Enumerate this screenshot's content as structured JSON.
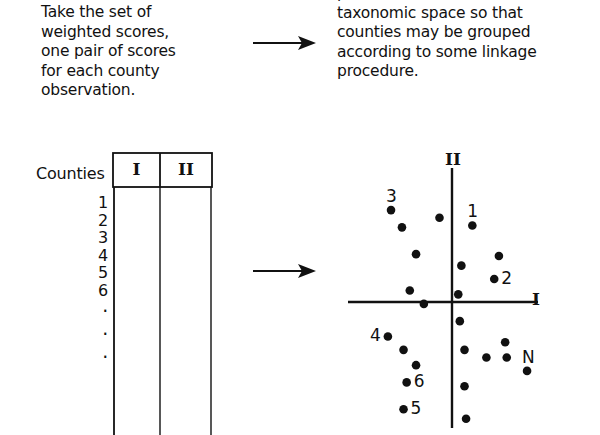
{
  "figure": {
    "caption_left": "Take the set of\nweighted scores,\none pair of scores\nfor each county\nobservation.",
    "caption_right": "point in a two-dimensional\ntaxonomic space so that\ncounties may be grouped\naccording to some linkage\nprocedure.",
    "arrow_top_name": "arrow-right",
    "arrow_bottom_name": "arrow-right"
  },
  "table": {
    "title": "Counties",
    "columns": [
      "I",
      "II"
    ],
    "row_labels": [
      "1",
      "2",
      "3",
      "4",
      "5",
      "6"
    ],
    "ellipsis": [
      "·",
      "·",
      "·"
    ],
    "last_row_label": "N"
  },
  "chart_data": {
    "type": "scatter",
    "title": "",
    "xlabel": "I",
    "ylabel": "II",
    "xlim": [
      -110,
      110
    ],
    "ylim": [
      -140,
      140
    ],
    "grid": false,
    "legend": false,
    "axis_origin_px": [
      122,
      154
    ],
    "axis_x_span_px": [
      18,
      208
    ],
    "axis_y_span_px": [
      20,
      280
    ],
    "annotations": [
      {
        "label": "3",
        "x": -78,
        "y": 104
      },
      {
        "label": "1",
        "x": 26,
        "y": 92
      },
      {
        "label": "2",
        "x": 66,
        "y": 27
      },
      {
        "label": "4",
        "x": -92,
        "y": -36
      },
      {
        "label": "6",
        "x": -50,
        "y": -82
      },
      {
        "label": "5",
        "x": -56,
        "y": -110
      },
      {
        "label": "N",
        "x": 102,
        "y": -44
      }
    ],
    "points": [
      {
        "id": "3",
        "x": -78,
        "y": 96,
        "label": "3",
        "label_pos": "above"
      },
      {
        "id": "p2",
        "x": -64,
        "y": 78,
        "label": "",
        "label_pos": ""
      },
      {
        "id": "p3",
        "x": -16,
        "y": 88,
        "label": "",
        "label_pos": ""
      },
      {
        "id": "p4",
        "x": -46,
        "y": 50,
        "label": "",
        "label_pos": ""
      },
      {
        "id": "p5",
        "x": -54,
        "y": 12,
        "label": "",
        "label_pos": ""
      },
      {
        "id": "p6",
        "x": -36,
        "y": -2,
        "label": "",
        "label_pos": ""
      },
      {
        "id": "1",
        "x": 26,
        "y": 80,
        "label": "1",
        "label_pos": "above"
      },
      {
        "id": "p8",
        "x": 60,
        "y": 48,
        "label": "",
        "label_pos": ""
      },
      {
        "id": "p9",
        "x": 12,
        "y": 38,
        "label": "",
        "label_pos": ""
      },
      {
        "id": "2",
        "x": 54,
        "y": 24,
        "label": "2",
        "label_pos": "right"
      },
      {
        "id": "p11",
        "x": 8,
        "y": 8,
        "label": "",
        "label_pos": ""
      },
      {
        "id": "p12",
        "x": 10,
        "y": -20,
        "label": "",
        "label_pos": ""
      },
      {
        "id": "4",
        "x": -82,
        "y": -36,
        "label": "4",
        "label_pos": "left"
      },
      {
        "id": "p14",
        "x": -62,
        "y": -50,
        "label": "",
        "label_pos": ""
      },
      {
        "id": "p15",
        "x": -46,
        "y": -66,
        "label": "",
        "label_pos": ""
      },
      {
        "id": "6",
        "x": -58,
        "y": -84,
        "label": "6",
        "label_pos": "right"
      },
      {
        "id": "5",
        "x": -62,
        "y": -112,
        "label": "5",
        "label_pos": "right"
      },
      {
        "id": "p18",
        "x": 16,
        "y": -50,
        "label": "",
        "label_pos": ""
      },
      {
        "id": "p19",
        "x": 44,
        "y": -58,
        "label": "",
        "label_pos": ""
      },
      {
        "id": "p20",
        "x": 68,
        "y": -42,
        "label": "",
        "label_pos": ""
      },
      {
        "id": "p21",
        "x": 70,
        "y": -58,
        "label": "",
        "label_pos": ""
      },
      {
        "id": "N",
        "x": 96,
        "y": -72,
        "label": "N",
        "label_pos": "above"
      },
      {
        "id": "p23",
        "x": 16,
        "y": -88,
        "label": "",
        "label_pos": ""
      },
      {
        "id": "p24",
        "x": 18,
        "y": -122,
        "label": "",
        "label_pos": ""
      }
    ]
  },
  "colors": {
    "ink": "#111111",
    "background": "#ffffff"
  }
}
